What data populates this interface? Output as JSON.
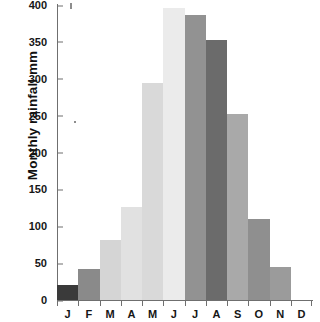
{
  "chart_data": {
    "type": "bar",
    "title": "",
    "subtitle": "",
    "xlabel": "",
    "ylabel": "Monthly rainfall mm",
    "categories": [
      "J",
      "F",
      "M",
      "A",
      "M",
      "J",
      "J",
      "A",
      "S",
      "O",
      "N",
      "D"
    ],
    "category_names": [
      "January",
      "February",
      "March",
      "April",
      "May",
      "June",
      "July",
      "August",
      "September",
      "October",
      "November",
      "December"
    ],
    "values": [
      20,
      42,
      81,
      126,
      294,
      396,
      387,
      353,
      252,
      110,
      45,
      0
    ],
    "units": "mm",
    "ylim": [
      0,
      400
    ],
    "ytick_values": [
      0,
      50,
      100,
      150,
      200,
      250,
      300,
      350,
      400
    ],
    "ytick_labels": [
      "0",
      "50",
      "100",
      "150",
      "200",
      "250",
      "300",
      "350",
      "400"
    ],
    "grid": false,
    "legend": null,
    "legend_position": "none",
    "bar_colors": [
      "#3a3a3a",
      "#8a8a8a",
      "#d5d5d5",
      "#e1e1e1",
      "#d9d9d9",
      "#ebebeb",
      "#929292",
      "#6b6b6b",
      "#a9a9a9",
      "#8f8f8f",
      "#9b9b9b",
      "#ffffff"
    ],
    "axis_color": "#6f6f6f",
    "text_color": "#161616",
    "background": "#ffffff"
  }
}
